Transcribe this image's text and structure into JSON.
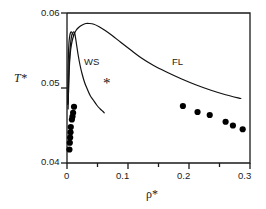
{
  "chart_data": {
    "type": "scatter",
    "title": "",
    "xlabel": "ρ*",
    "ylabel": "T*",
    "xlim": [
      0,
      0.3
    ],
    "ylim": [
      0.04,
      0.06
    ],
    "grid": false,
    "legend_position": "inline-annotations",
    "xticks": [
      "0",
      "0.1",
      "0.2",
      "0.3"
    ],
    "xtick_values": [
      0,
      0.1,
      0.2,
      0.3
    ],
    "xminor_values": [
      0.05,
      0.15,
      0.25
    ],
    "yticks": [
      "0.04",
      "0.05",
      "0.06"
    ],
    "ytick_values": [
      0.04,
      0.05,
      0.06
    ],
    "annotations": [
      {
        "text": "WS",
        "x": 0.035,
        "y": 0.0545
      },
      {
        "text": "FL",
        "x": 0.178,
        "y": 0.0545
      },
      {
        "text": "*",
        "x": 0.063,
        "y": 0.0498
      }
    ],
    "series": [
      {
        "name": "WS",
        "type": "line",
        "x": [
          0.002,
          0.003,
          0.0045,
          0.0062,
          0.008,
          0.0098,
          0.0112,
          0.0122,
          0.013,
          0.0142,
          0.016,
          0.0185,
          0.0215,
          0.025,
          0.029,
          0.033,
          0.038,
          0.043,
          0.049,
          0.0545,
          0.0585,
          0.061
        ],
        "y": [
          0.048,
          0.0516,
          0.0545,
          0.0562,
          0.0571,
          0.0574,
          0.0575,
          0.0574,
          0.0572,
          0.0566,
          0.0556,
          0.0543,
          0.053,
          0.0518,
          0.0507,
          0.0499,
          0.049,
          0.0484,
          0.0477,
          0.0472,
          0.0469,
          0.0467
        ]
      },
      {
        "name": "WS-left-branch",
        "type": "line",
        "x": [
          0.0012,
          0.0014,
          0.0018,
          0.0024,
          0.0032,
          0.0042,
          0.0054,
          0.0068,
          0.0082,
          0.0096,
          0.0108
        ],
        "y": [
          0.0478,
          0.05,
          0.0525,
          0.0546,
          0.056,
          0.0568,
          0.0573,
          0.0575,
          0.0574,
          0.0572,
          0.057
        ]
      },
      {
        "name": "FL",
        "type": "line",
        "x": [
          0.0018,
          0.0028,
          0.0042,
          0.006,
          0.0085,
          0.0115,
          0.015,
          0.0195,
          0.025,
          0.031,
          0.037,
          0.044,
          0.052,
          0.062,
          0.074,
          0.088,
          0.104,
          0.122,
          0.142,
          0.164,
          0.188,
          0.212,
          0.236,
          0.26,
          0.285
        ],
        "y": [
          0.0472,
          0.0505,
          0.0533,
          0.0551,
          0.0563,
          0.0571,
          0.0577,
          0.0581,
          0.0584,
          0.0586,
          0.0586,
          0.0585,
          0.0582,
          0.0577,
          0.057,
          0.0561,
          0.0551,
          0.054,
          0.053,
          0.0521,
          0.0512,
          0.0504,
          0.0497,
          0.0491,
          0.0486
        ]
      },
      {
        "name": "simulation-data",
        "type": "scatter",
        "marker": "filled-circle",
        "x": [
          0.0115,
          0.01,
          0.009,
          0.008,
          0.0062,
          0.0058,
          0.0052,
          0.0046,
          0.004,
          0.19,
          0.214,
          0.234,
          0.26,
          0.272,
          0.288
        ],
        "y": [
          0.0475,
          0.0467,
          0.0462,
          0.0458,
          0.0448,
          0.0441,
          0.0434,
          0.0427,
          0.0418,
          0.0476,
          0.0468,
          0.0464,
          0.0455,
          0.045,
          0.0445
        ]
      }
    ]
  },
  "axes": {
    "y_title": "T*",
    "x_title": "ρ*",
    "y_tick_labels": {
      "top": "0.06",
      "mid": "0.05",
      "bottom": "0.04"
    },
    "x_tick_labels": {
      "t0": "0",
      "t1": "0.1",
      "t2": "0.2",
      "t3": "0.3"
    }
  },
  "labels": {
    "ws": "WS",
    "fl": "FL",
    "star": "*"
  },
  "colors": {
    "line": "#111111",
    "marker": "#000000",
    "axis": "#1a1a1a",
    "background": "#ffffff"
  }
}
